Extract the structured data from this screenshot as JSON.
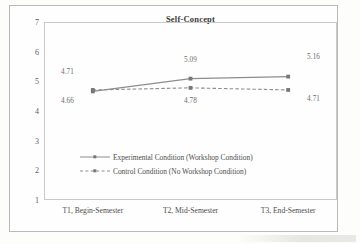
{
  "figure": {
    "title": "Self-Concept"
  },
  "chart_data": {
    "type": "line",
    "title": "Self-Concept",
    "xlabel": "",
    "ylabel": "",
    "categories": [
      "T1, Begin-Semester",
      "T2, Mid-Semester",
      "T3, End-Semester"
    ],
    "ylim": [
      1,
      7
    ],
    "yticks": [
      "7",
      "6",
      "5",
      "4",
      "3",
      "2",
      "1"
    ],
    "ytick_values": [
      7,
      6,
      5,
      4,
      3,
      2,
      1
    ],
    "grid": false,
    "legend_position": "inside-center",
    "series": [
      {
        "name": "Experimental Condition (Workshop Condition)",
        "values": [
          4.66,
          5.09,
          5.16
        ],
        "labels": [
          "4.66",
          "5.09",
          "5.16"
        ],
        "style": "solid",
        "marker": "square",
        "color": "#8d8d8b"
      },
      {
        "name": "Control Condition (No Workshop Condition)",
        "values": [
          4.71,
          4.78,
          4.71
        ],
        "labels": [
          "4.71",
          "4.78",
          "4.71"
        ],
        "style": "dashed",
        "marker": "square",
        "color": "#8d8d8b"
      }
    ],
    "point_labels": [
      {
        "text": "4.71",
        "x_pct": 8,
        "y_px": 72
      },
      {
        "text": "4.66",
        "x_pct": 8,
        "y_px": 101
      },
      {
        "text": "5.09",
        "x_pct": 50,
        "y_px": 60
      },
      {
        "text": "4.78",
        "x_pct": 50,
        "y_px": 101
      },
      {
        "text": "5.16",
        "x_pct": 92,
        "y_px": 57
      },
      {
        "text": "4.71",
        "x_pct": 92,
        "y_px": 99
      }
    ]
  }
}
